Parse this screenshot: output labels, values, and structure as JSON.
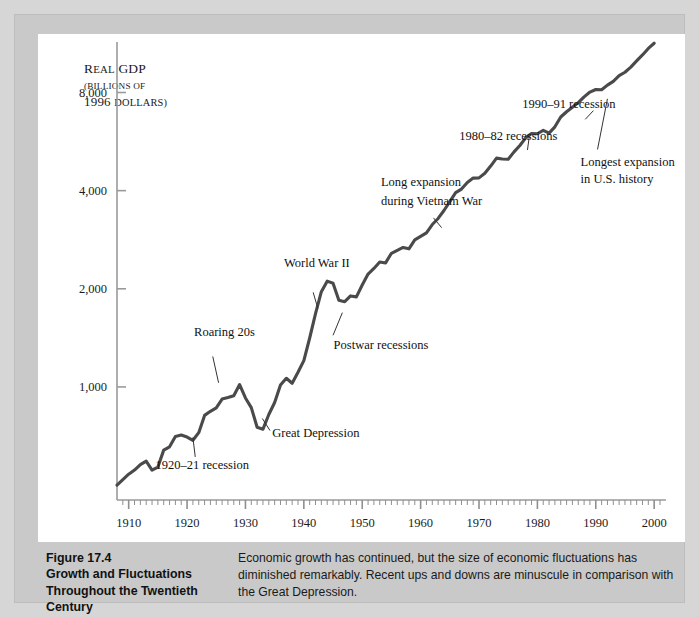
{
  "figure": {
    "number_label": "Figure 17.4",
    "title_line_1": "Growth and Fluctuations",
    "title_line_2": "Throughout the Twentieth",
    "title_line_3": "Century",
    "caption_text": "Economic growth has continued, but the size of economic fluctuations has diminished remarkably. Recent ups and downs are minuscule in comparison with the Great Depression."
  },
  "axis_title": {
    "line1_lead": "R",
    "line1_rest": "EAL",
    "line1_tail": " GDP",
    "line2": "(BILLIONS OF",
    "line3_num": "1996 ",
    "line3_rest": "DOLLARS)"
  },
  "colors": {
    "page_background": "#d6d6d6",
    "figure_background": "#c9c9c9",
    "panel_background": "#ffffff",
    "line_color": "#4a4a4a",
    "axis_color": "#9a9a9a",
    "text_color": "#1a1a1a"
  },
  "chart_data": {
    "type": "line",
    "title": "Growth and Fluctuations Throughout the Twentieth Century",
    "xlabel": "",
    "ylabel": "Real GDP (billions of 1996 dollars)",
    "yscale": "log",
    "ylim": [
      450,
      10500
    ],
    "xlim": [
      1908,
      2001
    ],
    "grid": false,
    "legend": null,
    "ytick_labels": [
      "1,000",
      "2,000",
      "4,000",
      "8,000"
    ],
    "ytick_values": [
      1000,
      2000,
      4000,
      8000
    ],
    "xtick_labels": [
      "1910",
      "1920",
      "1930",
      "1940",
      "1950",
      "1960",
      "1970",
      "1980",
      "1990",
      "2000"
    ],
    "xtick_values": [
      1910,
      1920,
      1930,
      1940,
      1950,
      1960,
      1970,
      1980,
      1990,
      2000
    ],
    "minor_xticks_every": 1,
    "series": [
      {
        "name": "Real GDP (billions of 1996 dollars)",
        "x": [
          1908,
          1909,
          1910,
          1911,
          1912,
          1913,
          1914,
          1915,
          1916,
          1917,
          1918,
          1919,
          1920,
          1921,
          1922,
          1923,
          1924,
          1925,
          1926,
          1927,
          1928,
          1929,
          1930,
          1931,
          1932,
          1933,
          1934,
          1935,
          1936,
          1937,
          1938,
          1939,
          1940,
          1941,
          1942,
          1943,
          1944,
          1945,
          1946,
          1947,
          1948,
          1949,
          1950,
          1951,
          1952,
          1953,
          1954,
          1955,
          1956,
          1957,
          1958,
          1959,
          1960,
          1961,
          1962,
          1963,
          1964,
          1965,
          1966,
          1967,
          1968,
          1969,
          1970,
          1971,
          1972,
          1973,
          1974,
          1975,
          1976,
          1977,
          1978,
          1979,
          1980,
          1981,
          1982,
          1983,
          1984,
          1985,
          1986,
          1987,
          1988,
          1989,
          1990,
          1991,
          1992,
          1993,
          1994,
          1995,
          1996,
          1997,
          1998,
          1999,
          2000
        ],
        "y": [
          500,
          520,
          540,
          556,
          578,
          592,
          556,
          568,
          640,
          655,
          705,
          712,
          702,
          686,
          724,
          818,
          842,
          862,
          918,
          928,
          940,
          1017,
          925,
          864,
          752,
          742,
          823,
          896,
          1013,
          1063,
          1026,
          1109,
          1204,
          1413,
          1678,
          1960,
          2111,
          2081,
          1844,
          1826,
          1902,
          1889,
          2054,
          2220,
          2309,
          2416,
          2401,
          2570,
          2625,
          2678,
          2652,
          2826,
          2895,
          2968,
          3149,
          3287,
          3477,
          3701,
          3943,
          4045,
          4239,
          4370,
          4378,
          4521,
          4759,
          5032,
          5002,
          4993,
          5260,
          5503,
          5808,
          5992,
          5977,
          6124,
          6006,
          6278,
          6728,
          6983,
          7209,
          7448,
          7757,
          8025,
          8172,
          8155,
          8427,
          8656,
          9012,
          9232,
          9570,
          9999,
          10430,
          10922,
          11330
        ]
      }
    ],
    "annotations": [
      {
        "text": "Roaring 20s",
        "target_year": 1925,
        "note": "leader line points to mid-1920s rise"
      },
      {
        "text": "1920–21 recession",
        "target_year": 1921,
        "note": "leader line points to early-1920s trough"
      },
      {
        "text": "Great Depression",
        "target_year": 1933,
        "note": "leader line points to 1933 trough"
      },
      {
        "text": "World War II",
        "target_year": 1944,
        "note": "leader line points to wartime peak"
      },
      {
        "text": "Postwar recessions",
        "target_year": 1947,
        "note": "leader line points to postwar dip"
      },
      {
        "text": "Long expansion",
        "target_year": 1967,
        "note": "first line of two-line label"
      },
      {
        "text": "during Vietnam War",
        "target_year": 1967,
        "note": "second line of two-line label"
      },
      {
        "text": "1980–82 recessions",
        "target_year": 1981,
        "note": "leader line points to early-1980s dips"
      },
      {
        "text": "1990–91 recession",
        "target_year": 1991,
        "note": "leader line points to 1991 flat spot"
      },
      {
        "text": "Longest expansion",
        "target_year": 1999,
        "note": "first line of two-line label"
      },
      {
        "text": "in U.S. history",
        "target_year": 1999,
        "note": "second line of two-line label"
      }
    ]
  }
}
